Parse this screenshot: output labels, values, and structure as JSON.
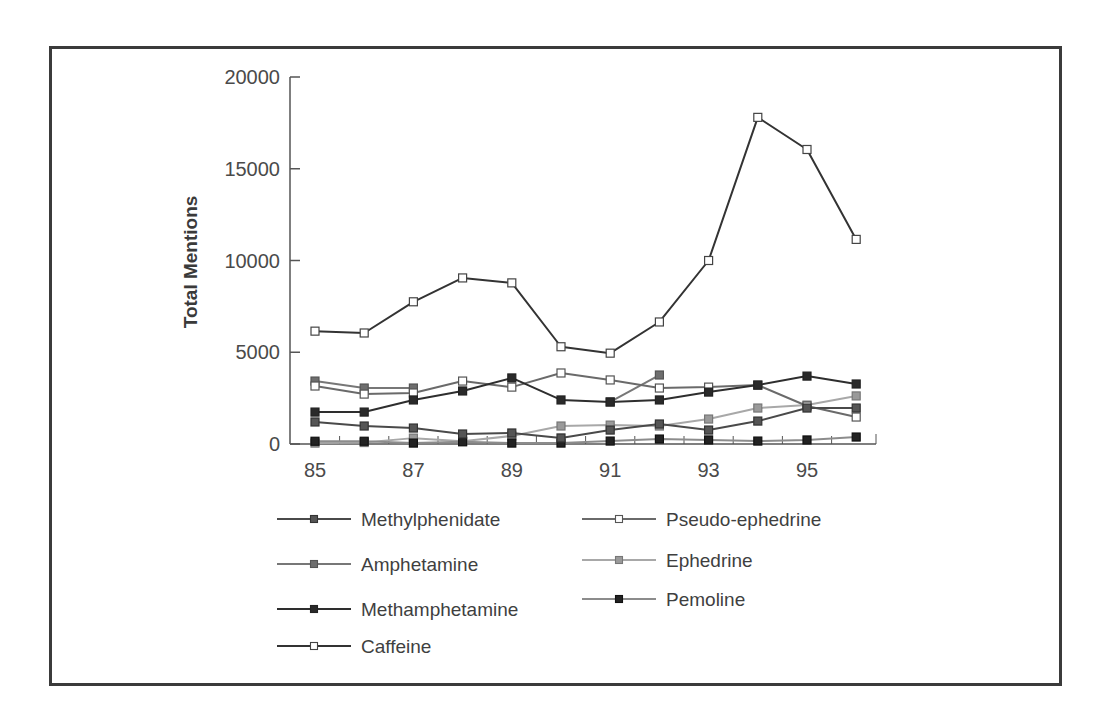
{
  "chart_data": {
    "type": "line",
    "title": "",
    "xlabel": "",
    "ylabel": "Total Mentions",
    "ylim": [
      0,
      20000
    ],
    "yticks": [
      0,
      5000,
      10000,
      15000,
      20000
    ],
    "ytick_labels": [
      "0",
      "5000",
      "10000",
      "15000",
      "20000"
    ],
    "x": [
      85,
      86,
      87,
      88,
      89,
      90,
      91,
      92,
      93,
      94,
      95,
      96
    ],
    "xtick_labels": [
      "85",
      "87",
      "89",
      "91",
      "93",
      "95"
    ],
    "xtick_values": [
      85,
      87,
      89,
      91,
      93,
      95
    ],
    "grid": false,
    "legend_position": "bottom",
    "series": [
      {
        "name": "Methylphenidate",
        "line_color": "#4a4a4a",
        "marker_fill": "#555555",
        "marker_stroke": "#333333",
        "values": [
          1200,
          980,
          870,
          545,
          600,
          330,
          760,
          1090,
          760,
          1250,
          1960,
          1960
        ]
      },
      {
        "name": "Amphetamine",
        "line_color": "#777777",
        "marker_fill": "#6e6e6e",
        "marker_stroke": "#555555",
        "values": [
          3430,
          3050,
          3050,
          null,
          null,
          null,
          2290,
          3760,
          null,
          null,
          null,
          null
        ]
      },
      {
        "name": "Methamphetamine",
        "line_color": "#2e2e2e",
        "marker_fill": "#2a2a2a",
        "marker_stroke": "#222222",
        "values": [
          1740,
          1740,
          2400,
          2890,
          3600,
          2400,
          2290,
          2400,
          2830,
          3210,
          3700,
          3270
        ]
      },
      {
        "name": "Caffeine",
        "line_color": "#333333",
        "marker_fill": "#ffffff",
        "marker_stroke": "#444444",
        "values": [
          6150,
          6050,
          7750,
          9050,
          8780,
          5300,
          4950,
          6650,
          10000,
          17800,
          16050,
          11150
        ]
      },
      {
        "name": "Pseudo-ephedrine",
        "line_color": "#6a6a6a",
        "marker_fill": "#ffffff",
        "marker_stroke": "#555555",
        "values": [
          3160,
          2720,
          2780,
          3430,
          3100,
          3870,
          3490,
          3050,
          3100,
          3210,
          2070,
          1470
        ]
      },
      {
        "name": "Ephedrine",
        "line_color": "#a8a8a8",
        "marker_fill": "#9a9a9a",
        "marker_stroke": "#777777",
        "values": [
          50,
          80,
          320,
          150,
          440,
          980,
          1030,
          980,
          1360,
          1960,
          2120,
          2620
        ]
      },
      {
        "name": "Pemoline",
        "line_color": "#8c8c8c",
        "marker_fill": "#222222",
        "marker_stroke": "#111111",
        "values": [
          150,
          150,
          50,
          120,
          50,
          50,
          160,
          270,
          220,
          160,
          220,
          380
        ]
      }
    ]
  },
  "legend": {
    "left": [
      "Methylphenidate",
      "Amphetamine",
      "Methamphetamine",
      "Caffeine"
    ],
    "right": [
      "Pseudo-ephedrine",
      "Ephedrine",
      "Pemoline"
    ]
  }
}
